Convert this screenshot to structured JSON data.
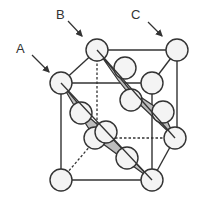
{
  "diagram": {
    "type": "crystal-lattice-unit-cell",
    "labels": [
      {
        "id": "A",
        "text": "A"
      },
      {
        "id": "B",
        "text": "B"
      },
      {
        "id": "C",
        "text": "C"
      }
    ],
    "colors": {
      "atom_fill": "#f4f4f4",
      "atom_stroke": "#333333",
      "plane_fill": "#bdbdbd",
      "edge": "#333333"
    }
  }
}
